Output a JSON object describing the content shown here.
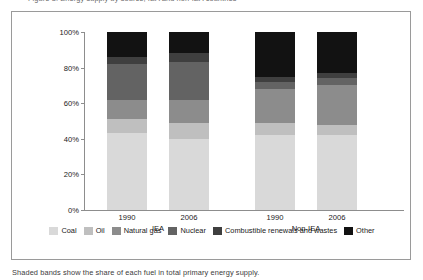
{
  "figure": {
    "top_clipped_caption": "Figure 3.  Energy supply by source, IEA and non-IEA countries",
    "bottom_clipped_note": "Shaded bands show the share of each fuel in total primary energy supply."
  },
  "axes": {
    "y_ticks": [
      "0%",
      "20%",
      "40%",
      "60%",
      "80%",
      "100%"
    ],
    "y_tick_values": [
      0,
      20,
      40,
      60,
      80,
      100
    ],
    "x_tick_labels": [
      "1990",
      "2006",
      "1990",
      "2006"
    ],
    "group_labels": [
      "IEA",
      "Non-IEA"
    ]
  },
  "legend": {
    "position": "bottom",
    "items": [
      {
        "label": "Coal",
        "color": "#d9d9d9"
      },
      {
        "label": "Oil",
        "color": "#bfbfbf"
      },
      {
        "label": "Natural gas",
        "color": "#8c8c8c"
      },
      {
        "label": "Nuclear",
        "color": "#636363"
      },
      {
        "label": "Combustible renewals and wastes",
        "color": "#3f3f3f"
      },
      {
        "label": "Other",
        "color": "#121212"
      }
    ]
  },
  "chart_data": {
    "type": "bar",
    "stacked": true,
    "normalized": true,
    "title": "Energy supply by source, IEA and non-IEA countries",
    "xlabel": "",
    "ylabel": "",
    "ylim": [
      0,
      100
    ],
    "grid": false,
    "legend_position": "bottom",
    "categories": [
      "1990",
      "2006",
      "1990",
      "2006"
    ],
    "groups": [
      {
        "name": "IEA",
        "categories": [
          "1990",
          "2006"
        ]
      },
      {
        "name": "Non-IEA",
        "categories": [
          "1990",
          "2006"
        ]
      }
    ],
    "series": [
      {
        "name": "Coal",
        "color": "#d9d9d9",
        "values": [
          43,
          40,
          42,
          42
        ]
      },
      {
        "name": "Oil",
        "color": "#bfbfbf",
        "values": [
          8,
          9,
          7,
          6
        ]
      },
      {
        "name": "Natural gas",
        "color": "#8c8c8c",
        "values": [
          11,
          13,
          19,
          22
        ]
      },
      {
        "name": "Nuclear",
        "color": "#636363",
        "values": [
          20,
          21,
          4,
          4
        ]
      },
      {
        "name": "Combustible renewals and wastes",
        "color": "#3f3f3f",
        "values": [
          4,
          5,
          3,
          3
        ]
      },
      {
        "name": "Other",
        "color": "#121212",
        "values": [
          14,
          12,
          25,
          23
        ]
      }
    ]
  }
}
